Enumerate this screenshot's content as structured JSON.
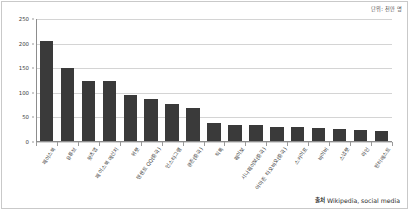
{
  "chart_data": {
    "type": "bar",
    "title": "",
    "subtitle": "",
    "unit_note": "단위: 천만 명",
    "xlabel": "",
    "ylabel": "",
    "ylim": [
      0,
      250
    ],
    "yticks": [
      0,
      50,
      100,
      150,
      200,
      250
    ],
    "grid": true,
    "legend": "none",
    "bar_color": "#3a3a3a",
    "categories": [
      "페이스북",
      "유튜브",
      "왓츠앱",
      "페이스북 메신저",
      "위챗",
      "텐센트 QQ(중국)",
      "인스타그램",
      "큐존(중국)",
      "틱톡",
      "웨이보",
      "시나웨이보(중국)",
      "아마존 타오바오(중국)",
      "스카이프",
      "바이버",
      "스냅챗",
      "라인",
      "핀터레스트"
    ],
    "values": [
      205,
      150,
      122,
      122,
      95,
      87,
      75,
      68,
      37,
      33,
      32,
      28,
      28,
      26,
      25,
      22,
      21
    ],
    "series": [
      {
        "name": "월간 활성 사용자",
        "values": [
          205,
          150,
          122,
          122,
          95,
          87,
          75,
          68,
          37,
          33,
          32,
          28,
          28,
          26,
          25,
          22,
          21
        ]
      }
    ]
  },
  "source": {
    "label": "출처",
    "text": "Wikipedia, social media"
  }
}
